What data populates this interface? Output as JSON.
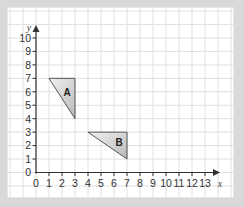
{
  "diagram": {
    "type": "coordinate_grid",
    "axes": {
      "x_label": "x",
      "y_label": "y",
      "x_ticks": [
        "0",
        "1",
        "2",
        "3",
        "4",
        "5",
        "6",
        "7",
        "8",
        "9",
        "10",
        "11",
        "12",
        "13"
      ],
      "y_ticks": [
        "0",
        "1",
        "2",
        "3",
        "4",
        "5",
        "6",
        "7",
        "8",
        "9",
        "10"
      ],
      "x_range": [
        0,
        13
      ],
      "y_range": [
        0,
        10
      ]
    },
    "shapes": [
      {
        "name": "A",
        "label": "A",
        "vertices": [
          [
            1,
            7
          ],
          [
            3,
            7
          ],
          [
            3,
            4
          ]
        ],
        "fill": "#cfcfcf"
      },
      {
        "name": "B",
        "label": "B",
        "vertices": [
          [
            4,
            3
          ],
          [
            7,
            3
          ],
          [
            7,
            1
          ]
        ],
        "fill": "#cfcfcf"
      }
    ],
    "colors": {
      "background": "#d9d9d9",
      "panel": "#ffffff",
      "grid": "#e0e0e0",
      "axis": "#333333",
      "shape_fill": "#cfcfcf",
      "shape_stroke": "#555555"
    }
  }
}
